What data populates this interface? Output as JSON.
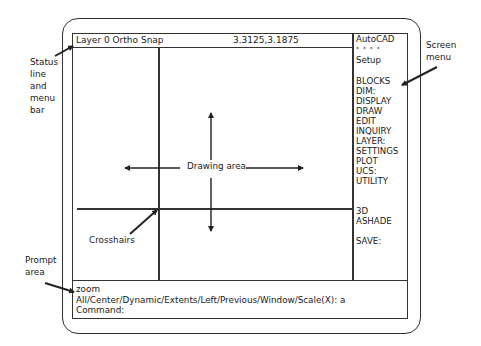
{
  "status_line": {
    "label": "Layer 0  Ortho  Snap",
    "coordinates": "3.3125,3.1875"
  },
  "screen_menu": {
    "items": [
      {
        "label": "AutoCAD"
      },
      {
        "label": "* * * *"
      },
      {
        "label": "Setup"
      },
      {
        "label": ""
      },
      {
        "label": "BLOCKS"
      },
      {
        "label": "DIM:"
      },
      {
        "label": "DISPLAY"
      },
      {
        "label": "DRAW"
      },
      {
        "label": "EDIT"
      },
      {
        "label": "INQUIRY"
      },
      {
        "label": "LAYER:"
      },
      {
        "label": "SETTINGS"
      },
      {
        "label": "PLOT"
      },
      {
        "label": "UCS:"
      },
      {
        "label": "UTILITY"
      },
      {
        "label": ""
      },
      {
        "label": ""
      },
      {
        "label": "3D"
      },
      {
        "label": "ASHADE"
      },
      {
        "label": ""
      },
      {
        "label": "SAVE:"
      }
    ]
  },
  "drawing_area": {
    "label": "Drawing area"
  },
  "prompt_area": {
    "lines": [
      "zoom",
      "All/Center/Dynamic/Extents/Left/Previous/Window/Scale(X):  a",
      "Command:"
    ]
  },
  "callouts": {
    "status_line": [
      "Status",
      "line",
      "and",
      "menu",
      "bar"
    ],
    "screen_menu": [
      "Screen",
      "menu"
    ],
    "crosshairs": "Crosshairs",
    "prompt_area": [
      "Prompt",
      "area"
    ]
  }
}
